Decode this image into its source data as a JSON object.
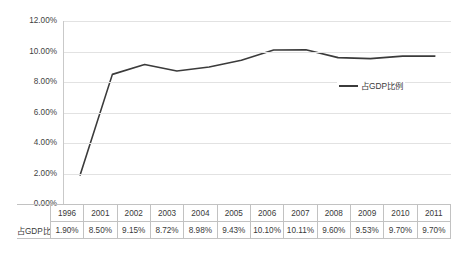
{
  "chart_data": {
    "type": "line",
    "title": "",
    "xlabel": "",
    "ylabel": "",
    "grid": true,
    "legend_position": "inside-right",
    "ylim": [
      0,
      12
    ],
    "y_ticks": [
      "0.00%",
      "2.00%",
      "4.00%",
      "6.00%",
      "8.00%",
      "10.00%",
      "12.00%"
    ],
    "y_tick_values": [
      0,
      2,
      4,
      6,
      8,
      10,
      12
    ],
    "categories": [
      "1996",
      "2001",
      "2002",
      "2003",
      "2004",
      "2005",
      "2006",
      "2007",
      "2008",
      "2009",
      "2010",
      "2011"
    ],
    "series": [
      {
        "name": "占GDP比例",
        "color": "#3b3b3b",
        "values": [
          1.9,
          8.5,
          9.15,
          8.72,
          8.98,
          9.43,
          10.1,
          10.11,
          9.6,
          9.53,
          9.7,
          9.7
        ],
        "labels": [
          "1.90%",
          "8.50%",
          "9.15%",
          "8.72%",
          "8.98%",
          "9.43%",
          "10.10%",
          "10.11%",
          "9.60%",
          "9.53%",
          "9.70%",
          "9.70%"
        ]
      }
    ]
  },
  "legend": {
    "entries": [
      {
        "label": "占GDP比例",
        "color": "#3b3b3b"
      }
    ]
  },
  "data_table": {
    "row_header": "占GDP比例",
    "columns": [
      "1996",
      "2001",
      "2002",
      "2003",
      "2004",
      "2005",
      "2006",
      "2007",
      "2008",
      "2009",
      "2010",
      "2011"
    ],
    "values": [
      "1.90%",
      "8.50%",
      "9.15%",
      "8.72%",
      "8.98%",
      "9.43%",
      "10.10%",
      "10.11%",
      "9.60%",
      "9.53%",
      "9.70%",
      "9.70%"
    ]
  }
}
